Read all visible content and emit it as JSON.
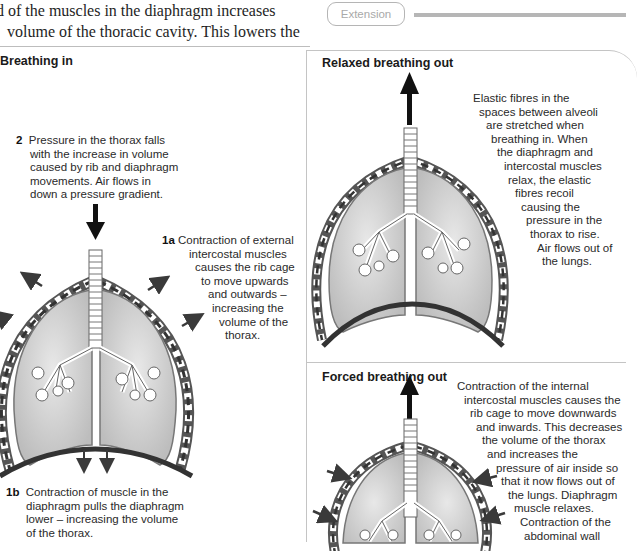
{
  "intro_text": {
    "lines": [
      "d of the muscles in the diaphragm increases",
      "volume of the thoracic cavity. This lowers the"
    ]
  },
  "extension_label": "Extension",
  "panels": {
    "breathing_in": {
      "title": "Breathing in",
      "step_2": {
        "number": "2",
        "lines": [
          "Pressure in the thorax falls",
          "with the increase in volume",
          "caused by rib and diaphragm",
          "movements. Air flows in",
          "down a pressure gradient."
        ]
      },
      "step_1a": {
        "number": "1a",
        "lines": [
          "Contraction of external",
          "intercostal muscles",
          "causes the rib cage",
          "to move upwards",
          "and outwards  –",
          "increasing the",
          "volume of the",
          "thorax."
        ]
      },
      "step_1b": {
        "number": "1b",
        "lines": [
          "Contraction of muscle in the",
          "diaphragm pulls the diaphragm",
          "lower – increasing the volume",
          "of the thorax."
        ]
      },
      "airflow_arrow": "down",
      "rib_arrows": "outward",
      "diaphragm_arrows": "down"
    },
    "relaxed_breathing_out": {
      "title": "Relaxed breathing out",
      "lines": [
        "Elastic fibres in the",
        "spaces between alveoli",
        "are stretched when",
        "breathing in. When",
        "the diaphragm and",
        "intercostal muscles",
        "relax, the elastic",
        "fibres recoil",
        "causing the",
        "pressure in the",
        "thorax to rise.",
        "Air flows out of",
        "the lungs."
      ],
      "airflow_arrow": "up"
    },
    "forced_breathing_out": {
      "title": "Forced breathing out",
      "lines": [
        "Contraction of the internal",
        "intercostal muscles causes the",
        "rib cage to move downwards",
        "and inwards. This decreases",
        "the volume of the thorax",
        "and increases the",
        "pressure of air inside so",
        "that it now flows out of",
        "the lungs. Diaphragm",
        "muscle relaxes.",
        "Contraction of the",
        "abdominal wall"
      ],
      "airflow_arrow": "up",
      "rib_arrows": "inward"
    }
  },
  "colors": {
    "lung_fill": "#d2d2d2",
    "rib_dark": "#3a3a3a",
    "border": "#c4c4c4",
    "extension_grey": "#b5b5b5"
  }
}
